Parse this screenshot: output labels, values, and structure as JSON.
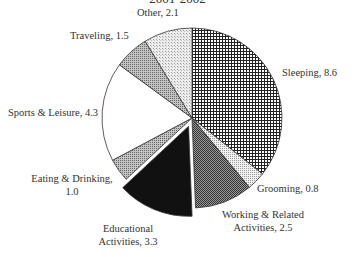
{
  "chart_data": {
    "type": "pie",
    "title": "2001-2002",
    "unit": "hours",
    "start_angle_deg": 0,
    "direction": "clockwise",
    "exploded": [
      "Educational Activities"
    ],
    "slices": [
      {
        "label": "Sleeping",
        "value": 8.6,
        "pattern": "fine-grid",
        "fill": "#ffffff",
        "ink": "#222222"
      },
      {
        "label": "Grooming",
        "value": 0.8,
        "pattern": "light-dots",
        "fill": "#e8e8e8",
        "ink": "#888888"
      },
      {
        "label": "Working & Related Activities",
        "value": 2.5,
        "pattern": "dark-checker",
        "fill": "#8a8a8a",
        "ink": "#333333"
      },
      {
        "label": "Educational Activities",
        "value": 3.3,
        "pattern": "solid",
        "fill": "#111111",
        "ink": "#111111"
      },
      {
        "label": "Eating & Drinking",
        "value": 1.0,
        "pattern": "medium-dots",
        "fill": "#b5b5b5",
        "ink": "#555555"
      },
      {
        "label": "Sports & Leisure",
        "value": 4.3,
        "pattern": "none",
        "fill": "#ffffff",
        "ink": "#ffffff"
      },
      {
        "label": "Traveling",
        "value": 1.5,
        "pattern": "medium-dots",
        "fill": "#a8a8a8",
        "ink": "#555555"
      },
      {
        "label": "Other",
        "value": 2.1,
        "pattern": "light-checker",
        "fill": "#e6e6e6",
        "ink": "#999999"
      }
    ]
  },
  "labels": {
    "title": "2001-2002",
    "other": "Other, 2.1",
    "traveling": "Traveling, 1.5",
    "sports": "Sports & Leisure, 4.3",
    "eating_1": "Eating & Drinking,",
    "eating_2": "1.0",
    "educational_1": "Educational",
    "educational_2": "Activities, 3.3",
    "working_1": "Working & Related",
    "working_2": "Activities, 2.5",
    "grooming": "Grooming, 0.8",
    "sleeping": "Sleeping, 8.6"
  }
}
